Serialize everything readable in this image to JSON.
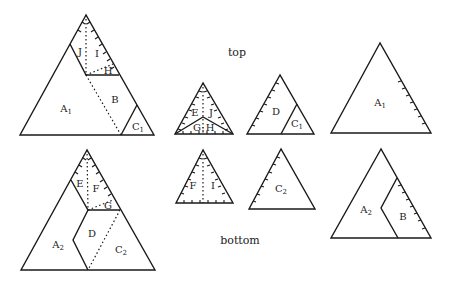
{
  "captions": {
    "top": "top",
    "bottom": "bottom"
  },
  "pieces": {
    "big_top": {
      "A1": "A",
      "A1_sub": "1",
      "B": "B",
      "C1": "C",
      "C1_sub": "1",
      "H": "H",
      "I": "I",
      "J": "J"
    },
    "big_bottom": {
      "A2": "A",
      "A2_sub": "2",
      "C2": "C",
      "C2_sub": "2",
      "D": "D",
      "E": "E",
      "F": "F",
      "G": "G"
    },
    "small_EJGH": {
      "E": "E",
      "J": "J",
      "G": "G",
      "H": "H",
      "sep": ":"
    },
    "small_FI": {
      "F": "F",
      "I": "I"
    },
    "mid_DC1": {
      "D": "D",
      "C1": "C",
      "C1_sub": "1"
    },
    "mid_C2": {
      "C2": "C",
      "C2_sub": "2"
    },
    "right_A1": {
      "A1": "A",
      "A1_sub": "1"
    },
    "right_A2B": {
      "A2": "A",
      "A2_sub": "2",
      "B": "B"
    }
  },
  "colors": {
    "stroke": "#1a1a1a",
    "background": "#ffffff"
  }
}
